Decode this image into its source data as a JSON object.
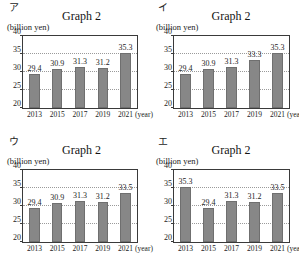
{
  "page": {
    "kind": "multiple-choice-bar-chart-figure",
    "panel_count": 4
  },
  "axis": {
    "unit_label": "(billion yen)",
    "y_ticks": [
      "40",
      "35",
      "30",
      "25",
      "20"
    ],
    "x_unit": "(year)",
    "categories": [
      "2013",
      "2015",
      "2017",
      "2019",
      "2021"
    ]
  },
  "panels": [
    {
      "letter": "ア",
      "title": "Graph 2",
      "values": [
        "29.4",
        "30.9",
        "31.3",
        "31.2",
        "35.3"
      ]
    },
    {
      "letter": "イ",
      "title": "Graph 2",
      "values": [
        "29.4",
        "30.9",
        "31.3",
        "33.3",
        "35.3"
      ]
    },
    {
      "letter": "ウ",
      "title": "Graph 2",
      "values": [
        "29.4",
        "30.9",
        "31.3",
        "31.2",
        "33.5"
      ]
    },
    {
      "letter": "エ",
      "title": "Graph 2",
      "values": [
        "35.3",
        "29.4",
        "31.3",
        "31.2",
        "33.5"
      ]
    }
  ],
  "chart_data": [
    {
      "type": "bar",
      "panel_label": "ア",
      "title": "Graph 2",
      "categories": [
        "2013",
        "2015",
        "2017",
        "2019",
        "2021"
      ],
      "values": [
        29.4,
        30.9,
        31.3,
        31.2,
        35.3
      ],
      "xlabel": "(year)",
      "ylabel": "(billion yen)",
      "ylim": [
        20,
        40
      ],
      "yticks": [
        20,
        25,
        30,
        35,
        40
      ],
      "grid": true,
      "legend": false,
      "bar_color": "#878787"
    },
    {
      "type": "bar",
      "panel_label": "イ",
      "title": "Graph 2",
      "categories": [
        "2013",
        "2015",
        "2017",
        "2019",
        "2021"
      ],
      "values": [
        29.4,
        30.9,
        31.3,
        33.3,
        35.3
      ],
      "xlabel": "(year)",
      "ylabel": "(billion yen)",
      "ylim": [
        20,
        40
      ],
      "yticks": [
        20,
        25,
        30,
        35,
        40
      ],
      "grid": true,
      "legend": false,
      "bar_color": "#878787"
    },
    {
      "type": "bar",
      "panel_label": "ウ",
      "title": "Graph 2",
      "categories": [
        "2013",
        "2015",
        "2017",
        "2019",
        "2021"
      ],
      "values": [
        29.4,
        30.9,
        31.3,
        31.2,
        33.5
      ],
      "xlabel": "(year)",
      "ylabel": "(billion yen)",
      "ylim": [
        20,
        40
      ],
      "yticks": [
        20,
        25,
        30,
        35,
        40
      ],
      "grid": true,
      "legend": false,
      "bar_color": "#878787"
    },
    {
      "type": "bar",
      "panel_label": "エ",
      "title": "Graph 2",
      "categories": [
        "2013",
        "2015",
        "2017",
        "2019",
        "2021"
      ],
      "values": [
        35.3,
        29.4,
        31.3,
        31.2,
        33.5
      ],
      "xlabel": "(year)",
      "ylabel": "(billion yen)",
      "ylim": [
        20,
        40
      ],
      "yticks": [
        20,
        25,
        30,
        35,
        40
      ],
      "grid": true,
      "legend": false,
      "bar_color": "#878787"
    }
  ]
}
